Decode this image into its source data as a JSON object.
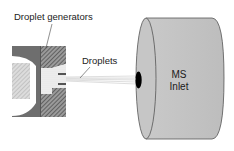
{
  "diagram": {
    "labels": {
      "droplet_generators": "Droplet generators",
      "droplets": "Droplets",
      "ms_line1": "MS",
      "ms_line2": "Inlet"
    },
    "colors": {
      "cylinder_fill": "#c4c4c4",
      "cylinder_edge": "#555555",
      "dark_block": "#6e6e6e",
      "hatch": "#444444",
      "light_hatch": "#bdbdbd",
      "inlet_hole": "#000000"
    }
  }
}
